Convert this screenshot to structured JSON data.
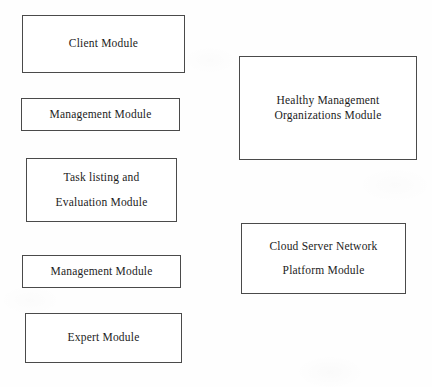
{
  "diagram": {
    "type": "block-diagram",
    "width": 432,
    "height": 387,
    "background_color": "#fefefe",
    "border_color": "#4a4a4a",
    "text_color": "#1c1c1c",
    "nodes": [
      {
        "id": "client-module",
        "lines": [
          "Client Module"
        ],
        "x": 22,
        "y": 15,
        "w": 163,
        "h": 58,
        "column": "left"
      },
      {
        "id": "management-module-top",
        "lines": [
          "Management Module"
        ],
        "x": 21,
        "y": 98,
        "w": 159,
        "h": 33,
        "column": "left"
      },
      {
        "id": "task-listing-and-evaluation-module",
        "lines": [
          "Task listing and",
          "Evaluation Module"
        ],
        "x": 26,
        "y": 158,
        "w": 151,
        "h": 64,
        "column": "left"
      },
      {
        "id": "management-module-bottom",
        "lines": [
          "Management Module"
        ],
        "x": 22,
        "y": 255,
        "w": 159,
        "h": 33,
        "column": "left"
      },
      {
        "id": "expert-module",
        "lines": [
          "Expert Module"
        ],
        "x": 25,
        "y": 313,
        "w": 157,
        "h": 50,
        "column": "left"
      },
      {
        "id": "healthy-management-organizations-module",
        "lines": [
          "Healthy Management",
          "Organizations Module"
        ],
        "x": 239,
        "y": 56,
        "w": 178,
        "h": 104,
        "column": "right"
      },
      {
        "id": "cloud-server-network-platform-module",
        "lines": [
          "Cloud Server Network",
          "Platform Module"
        ],
        "x": 241,
        "y": 223,
        "w": 165,
        "h": 71,
        "column": "right"
      }
    ]
  }
}
